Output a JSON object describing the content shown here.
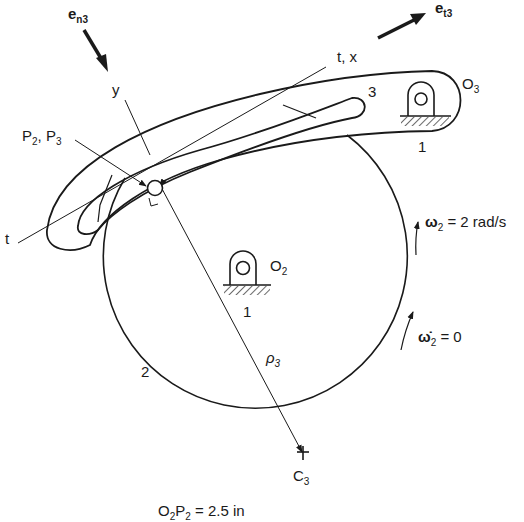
{
  "figure": {
    "labels": {
      "e_n3": {
        "base": "e",
        "sub": "n3"
      },
      "e_t3": {
        "base": "e",
        "sub": "t3"
      },
      "y_axis": "y",
      "tx_axis": "t, x",
      "t_axis": "t",
      "link3": "3",
      "O3": {
        "base": "O",
        "sub": "3"
      },
      "ground_O3": "1",
      "P2P3": {
        "p2": "P",
        "p2sub": "2",
        "sep": ", ",
        "p3": "P",
        "p3sub": "3"
      },
      "omega2": {
        "sym": "ω",
        "sub": "2",
        "rest": " = 2 rad/s"
      },
      "omega2dot": {
        "sym": "ω̇",
        "sub": "2",
        "rest": " = 0"
      },
      "O2": {
        "base": "O",
        "sub": "2"
      },
      "ground_O2": "1",
      "link2": "2",
      "rho3": {
        "sym": "ρ",
        "sub": "3"
      },
      "C3": {
        "base": "C",
        "sub": "3"
      },
      "caption": {
        "a": "O",
        "asub": "2",
        "b": "P",
        "bsub": "2",
        "rest": " = 2.5 in"
      }
    },
    "colors": {
      "ink": "#1a1a1a",
      "background": "#ffffff"
    }
  }
}
